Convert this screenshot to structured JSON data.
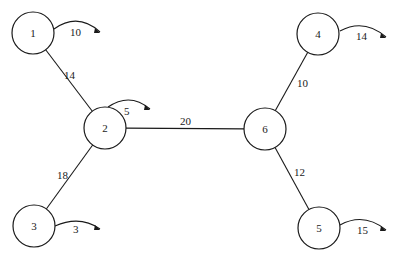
{
  "diagram": {
    "type": "weighted-graph",
    "colors": {
      "stroke": "#1a1a1a",
      "background": "#ffffff"
    },
    "nodes": [
      {
        "id": "1",
        "label": "1",
        "cx": 33,
        "cy": 33,
        "r": 21
      },
      {
        "id": "2",
        "label": "2",
        "cx": 105,
        "cy": 128,
        "r": 21
      },
      {
        "id": "3",
        "label": "3",
        "cx": 34,
        "cy": 226,
        "r": 21
      },
      {
        "id": "4",
        "label": "4",
        "cx": 318,
        "cy": 34,
        "r": 21
      },
      {
        "id": "5",
        "label": "5",
        "cx": 319,
        "cy": 228,
        "r": 21
      },
      {
        "id": "6",
        "label": "6",
        "cx": 265,
        "cy": 129,
        "r": 21
      }
    ],
    "edges": [
      {
        "from": "1",
        "to": "2",
        "weight": "14",
        "label_x": 64,
        "label_y": 79
      },
      {
        "from": "2",
        "to": "3",
        "weight": "18",
        "label_x": 57,
        "label_y": 179
      },
      {
        "from": "2",
        "to": "6",
        "weight": "20",
        "label_x": 180,
        "label_y": 125
      },
      {
        "from": "6",
        "to": "4",
        "weight": "10",
        "label_x": 297,
        "label_y": 87
      },
      {
        "from": "6",
        "to": "5",
        "weight": "12",
        "label_x": 294,
        "label_y": 176
      }
    ],
    "external_arrows": [
      {
        "node": "1",
        "value": "10",
        "path": "M54,29 Q78,12 100,32",
        "tip_x": 100,
        "tip_y": 32,
        "label_x": 70,
        "label_y": 36
      },
      {
        "node": "2",
        "value": "5",
        "path": "M108,107 Q130,92 150,109",
        "tip_x": 150,
        "tip_y": 109,
        "label_x": 124,
        "label_y": 115
      },
      {
        "node": "3",
        "value": "3",
        "path": "M55,226 Q80,215 100,229",
        "tip_x": 100,
        "tip_y": 229,
        "label_x": 73,
        "label_y": 233
      },
      {
        "node": "4",
        "value": "14",
        "path": "M340,31 Q364,18 386,37",
        "tip_x": 386,
        "tip_y": 37,
        "label_x": 356,
        "label_y": 40
      },
      {
        "node": "5",
        "value": "15",
        "path": "M340,225 Q364,212 386,230",
        "tip_x": 386,
        "tip_y": 230,
        "label_x": 357,
        "label_y": 234
      }
    ]
  }
}
